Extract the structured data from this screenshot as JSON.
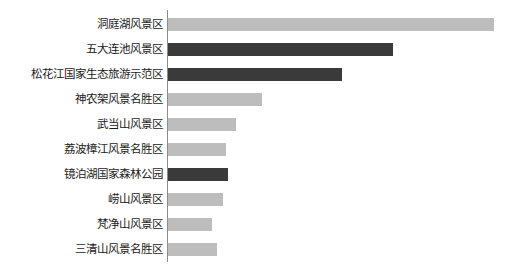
{
  "chart_data": {
    "type": "bar",
    "orientation": "horizontal",
    "title": "",
    "subtitle": "",
    "xlabel": "",
    "ylabel": "",
    "grid": false,
    "legend": "none",
    "axis_line_color": "#8c8c8c",
    "background": "#ffffff",
    "colors": {
      "light": "#bdbdbd",
      "dark": "#3a3a3a"
    },
    "xlim": [
      0,
      326
    ],
    "categories": [
      "洞庭湖风景区",
      "五大连池风景区",
      "松花江国家生态旅游示范区",
      "神农架风景名胜区",
      "武当山风景区",
      "荔波樟江风景名胜区",
      "镜泊湖国家森林公园",
      "崂山风景区",
      "梵净山风景区",
      "三清山风景名胜区"
    ],
    "values": [
      326,
      225,
      174,
      94,
      68,
      58,
      60,
      55,
      44,
      49
    ],
    "bar_colors": [
      "#bdbdbd",
      "#3a3a3a",
      "#3a3a3a",
      "#bdbdbd",
      "#bdbdbd",
      "#bdbdbd",
      "#3a3a3a",
      "#bdbdbd",
      "#bdbdbd",
      "#bdbdbd"
    ],
    "bars": [
      {
        "label": "洞庭湖风景区",
        "value": 326,
        "color": "#bdbdbd"
      },
      {
        "label": "五大连池风景区",
        "value": 225,
        "color": "#3a3a3a"
      },
      {
        "label": "松花江国家生态旅游示范区",
        "value": 174,
        "color": "#3a3a3a"
      },
      {
        "label": "神农架风景名胜区",
        "value": 94,
        "color": "#bdbdbd"
      },
      {
        "label": "武当山风景区",
        "value": 68,
        "color": "#bdbdbd"
      },
      {
        "label": "荔波樟江风景名胜区",
        "value": 58,
        "color": "#bdbdbd"
      },
      {
        "label": "镜泊湖国家森林公园",
        "value": 60,
        "color": "#3a3a3a"
      },
      {
        "label": "崂山风景区",
        "value": 55,
        "color": "#bdbdbd"
      },
      {
        "label": "梵净山风景区",
        "value": 44,
        "color": "#bdbdbd"
      },
      {
        "label": "三清山风景名胜区",
        "value": 49,
        "color": "#bdbdbd"
      }
    ]
  }
}
